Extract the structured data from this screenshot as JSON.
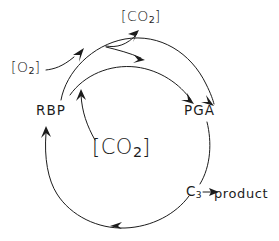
{
  "diagram": {
    "style": {
      "background_color": "#ffffff",
      "ink_color": "#1c1c1c",
      "stroke_width": 1
    },
    "labels": {
      "co2_top": {
        "text": "[CO",
        "sub": "2",
        "close": "]"
      },
      "o2_left": {
        "text": "[O",
        "sub": "2",
        "close": "]"
      },
      "rbp": {
        "text": "RBP"
      },
      "pga": {
        "text": "PGA"
      },
      "co2_middle": {
        "text": "[CO",
        "sub": "2",
        "close": "]"
      },
      "c3": {
        "text": "C",
        "sub": "3"
      },
      "product": {
        "text": "product"
      }
    },
    "nodes": [
      {
        "id": "rbp",
        "label": "RBP",
        "x": 52,
        "y": 110
      },
      {
        "id": "pga",
        "label": "PGA",
        "x": 200,
        "y": 110
      },
      {
        "id": "c3",
        "label": "C3",
        "x": 192,
        "y": 192
      },
      {
        "id": "product",
        "label": "product",
        "x": 246,
        "y": 193
      },
      {
        "id": "co2_top",
        "label": "[CO2]",
        "x": 140,
        "y": 16
      },
      {
        "id": "o2_left",
        "label": "[O2]",
        "x": 30,
        "y": 67
      },
      {
        "id": "co2_middle",
        "label": "[CO2]",
        "x": 122,
        "y": 148
      }
    ],
    "edges": [
      {
        "from": "rbp",
        "to": "pga",
        "kind": "outer-arc-top",
        "arrowheads": 2,
        "note": "oxygenation pathway over the top"
      },
      {
        "from": "rbp",
        "to": "pga",
        "kind": "inner-arc-top",
        "arrowheads": 1,
        "note": "carboxylation pathway"
      },
      {
        "from": "outer-arc",
        "to": "co2_top",
        "kind": "branch-arrow",
        "arrowheads": 1,
        "note": "CO2 released"
      },
      {
        "from": "o2_left",
        "to": "outer-arc",
        "kind": "feed-line",
        "arrowheads": 0,
        "note": "O2 enters"
      },
      {
        "from": "co2_middle",
        "to": "inner-arc",
        "kind": "feed-arrow",
        "arrowheads": 1,
        "note": "CO2 fixed"
      },
      {
        "from": "pga",
        "to": "c3",
        "kind": "right-arc",
        "arrowheads": 0
      },
      {
        "from": "c3",
        "to": "product",
        "kind": "straight-arrow",
        "arrowheads": 1
      },
      {
        "from": "c3",
        "to": "rbp",
        "kind": "bottom-arc",
        "arrowheads": 2,
        "note": "regeneration around the bottom"
      }
    ]
  }
}
